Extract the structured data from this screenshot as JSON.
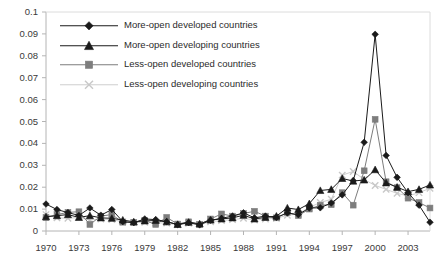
{
  "chart_data": {
    "type": "line",
    "title": "",
    "xlabel": "",
    "ylabel": "",
    "xlim": [
      1970,
      2005
    ],
    "ylim": [
      0,
      0.1
    ],
    "grid": false,
    "legend_position": "top-left",
    "x": [
      1970,
      1971,
      1972,
      1973,
      1974,
      1975,
      1976,
      1977,
      1978,
      1979,
      1980,
      1981,
      1982,
      1983,
      1984,
      1985,
      1986,
      1987,
      1988,
      1989,
      1990,
      1991,
      1992,
      1993,
      1994,
      1995,
      1996,
      1997,
      1998,
      1999,
      2000,
      2001,
      2002,
      2003,
      2004,
      2005
    ],
    "xtick_labels": [
      "1970",
      "1973",
      "1976",
      "1979",
      "1982",
      "1985",
      "1988",
      "1991",
      "1994",
      "1997",
      "2000",
      "2003"
    ],
    "xticks": [
      1970,
      1973,
      1976,
      1979,
      1982,
      1985,
      1988,
      1991,
      1994,
      1997,
      2000,
      2003
    ],
    "ytick_labels": [
      "0",
      "0.01",
      "0.02",
      "0.03",
      "0.04",
      "0.05",
      "0.06",
      "0.07",
      "0.08",
      "0.09",
      "0.1"
    ],
    "yticks": [
      0,
      0.01,
      0.02,
      0.03,
      0.04,
      0.05,
      0.06,
      0.07,
      0.08,
      0.09,
      0.1
    ],
    "series": [
      {
        "name": "More-open developed countries",
        "marker": "diamond",
        "color": "#1a1a1a",
        "values": [
          0.0123,
          0.0098,
          0.0084,
          0.0071,
          0.0105,
          0.0072,
          0.0098,
          0.0043,
          0.0038,
          0.0055,
          0.0052,
          0.0043,
          0.0029,
          0.0038,
          0.0028,
          0.0049,
          0.0058,
          0.0068,
          0.0083,
          0.006,
          0.0068,
          0.0062,
          0.0082,
          0.0075,
          0.0105,
          0.0106,
          0.0128,
          0.0165,
          0.023,
          0.0405,
          0.0898,
          0.0345,
          0.0245,
          0.0175,
          0.0118,
          0.004
        ]
      },
      {
        "name": "More-open developing countries",
        "marker": "triangle",
        "color": "#1a1a1a",
        "values": [
          0.0065,
          0.007,
          0.0075,
          0.0062,
          0.007,
          0.006,
          0.0058,
          0.005,
          0.0042,
          0.0046,
          0.0048,
          0.0042,
          0.003,
          0.004,
          0.0033,
          0.005,
          0.0055,
          0.006,
          0.0072,
          0.0055,
          0.0062,
          0.0068,
          0.0105,
          0.0098,
          0.0125,
          0.0185,
          0.019,
          0.024,
          0.0228,
          0.0233,
          0.028,
          0.022,
          0.02,
          0.018,
          0.019,
          0.021
        ]
      },
      {
        "name": "Less-open developed countries",
        "marker": "square",
        "color": "#7d7d7d",
        "values": [
          0.0062,
          0.0075,
          0.0085,
          0.0088,
          0.003,
          0.0068,
          0.0075,
          0.004,
          0.004,
          0.0048,
          0.003,
          0.0062,
          0.0032,
          0.0042,
          0.003,
          0.0055,
          0.0078,
          0.0068,
          0.008,
          0.009,
          0.0068,
          0.006,
          0.0085,
          0.007,
          0.01,
          0.0118,
          0.012,
          0.0175,
          0.0118,
          0.0275,
          0.051,
          0.0225,
          0.0198,
          0.015,
          0.013,
          0.0105
        ]
      },
      {
        "name": "Less-open developing countries",
        "marker": "x",
        "color": "#c8c8c8",
        "values": [
          0.0075,
          0.006,
          0.0058,
          0.0062,
          0.005,
          0.0055,
          0.0052,
          0.0042,
          0.0038,
          0.004,
          0.0038,
          0.0036,
          0.0028,
          0.0035,
          0.003,
          0.0042,
          0.0048,
          0.0052,
          0.0058,
          0.005,
          0.0055,
          0.0058,
          0.0072,
          0.0078,
          0.0108,
          0.013,
          0.0145,
          0.0255,
          0.0272,
          0.0235,
          0.0208,
          0.019,
          0.0172,
          0.016,
          0.0175,
          0.0195
        ]
      }
    ]
  },
  "legend": {
    "items": [
      {
        "label": "More-open developed countries",
        "marker": "diamond-marker-icon",
        "color": "#1a1a1a"
      },
      {
        "label": "More-open developing countries",
        "marker": "triangle-marker-icon",
        "color": "#1a1a1a"
      },
      {
        "label": "Less-open developed countries",
        "marker": "square-marker-icon",
        "color": "#7d7d7d"
      },
      {
        "label": "Less-open developing countries",
        "marker": "x-marker-icon",
        "color": "#c8c8c8"
      }
    ]
  },
  "axes": {
    "axis_line_color": "#b4b4b4",
    "tick_color": "#b4b4b4",
    "label_color": "#3a3a3a"
  }
}
